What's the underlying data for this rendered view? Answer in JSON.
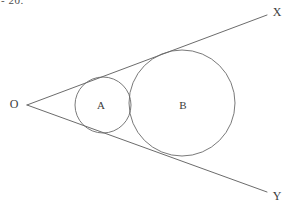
{
  "figure": {
    "header_fragment": "- 20.",
    "background_color": "#ffffff",
    "stroke_color": "#5a5a5a",
    "label_color": "#3c3c3c",
    "width": 288,
    "height": 205
  },
  "labels": {
    "vertex": "O",
    "ray_upper": "X",
    "ray_lower": "Y",
    "circle_small": "A",
    "circle_large": "B"
  },
  "chart_data": {
    "type": "diagram",
    "title": "",
    "vertex": {
      "label": "O",
      "x": 27,
      "y": 105
    },
    "rays": [
      {
        "name": "OX",
        "label": "X",
        "from": [
          27,
          105
        ],
        "to": [
          267,
          15
        ],
        "label_pos": [
          277,
          12
        ]
      },
      {
        "name": "OY",
        "label": "Y",
        "from": [
          27,
          105
        ],
        "to": [
          267,
          192
        ],
        "label_pos": [
          277,
          196
        ]
      }
    ],
    "circles": [
      {
        "label": "A",
        "cx": 103,
        "cy": 105,
        "r": 28,
        "label_pos": [
          101,
          105
        ]
      },
      {
        "label": "B",
        "cx": 182,
        "cy": 103,
        "r": 53,
        "label_pos": [
          183,
          105
        ]
      }
    ],
    "xlabel": "",
    "ylabel": "",
    "grid": false,
    "legend": false
  }
}
